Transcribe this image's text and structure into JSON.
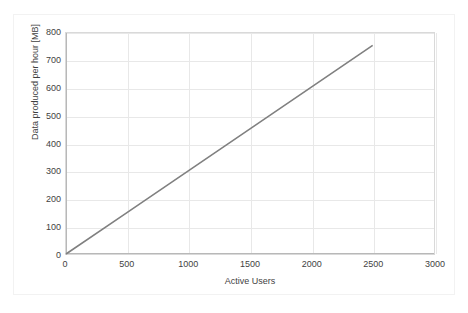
{
  "chart_data": {
    "type": "line",
    "title": "",
    "xlabel": "Active Users",
    "ylabel": "Data produced per hour [MB]",
    "xlim": [
      0,
      3000
    ],
    "ylim": [
      0,
      800
    ],
    "xticks": [
      0,
      500,
      1000,
      1500,
      2000,
      2500,
      3000
    ],
    "yticks": [
      0,
      100,
      200,
      300,
      400,
      500,
      600,
      700,
      800
    ],
    "xtick_labels": [
      "0",
      "500",
      "1000",
      "1500",
      "2000",
      "2500",
      "3000"
    ],
    "ytick_labels": [
      "0",
      "100",
      "200",
      "300",
      "400",
      "500",
      "600",
      "700",
      "800"
    ],
    "grid": true,
    "legend": false,
    "series": [
      {
        "name": "Data produced per hour",
        "color": "#808080",
        "x": [
          0,
          2500
        ],
        "values": [
          0,
          755
        ],
        "points": [
          {
            "x": 0,
            "y": 0
          },
          {
            "x": 500,
            "y": 151
          },
          {
            "x": 1000,
            "y": 302
          },
          {
            "x": 1500,
            "y": 453
          },
          {
            "x": 2000,
            "y": 604
          },
          {
            "x": 2500,
            "y": 755
          }
        ]
      }
    ]
  },
  "style": {
    "series_color": "#808080",
    "gridline_color": "#e8e8e8",
    "axis_color": "#b8b8b8",
    "plot_border_color": "#d9d9d9",
    "frame_border_color": "#f2f2f2",
    "text_color": "#3f3f3f",
    "background": "#ffffff"
  }
}
